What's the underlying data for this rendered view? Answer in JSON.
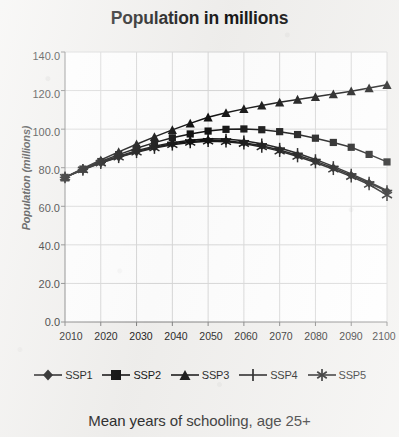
{
  "chart_data": {
    "type": "line",
    "title": "Population in millions",
    "xlabel": "",
    "ylabel": "Population (millions)",
    "x": [
      2010,
      2015,
      2020,
      2025,
      2030,
      2035,
      2040,
      2045,
      2050,
      2055,
      2060,
      2065,
      2070,
      2075,
      2080,
      2085,
      2090,
      2095,
      2100
    ],
    "xlim": [
      2010,
      2100
    ],
    "ylim": [
      0.0,
      140.0
    ],
    "xticks": [
      "2010",
      "2020",
      "2030",
      "2040",
      "2050",
      "2060",
      "2070",
      "2080",
      "2090",
      "2100"
    ],
    "yticks": [
      "0.0",
      "20.0",
      "40.0",
      "60.0",
      "80.0",
      "100.0",
      "120.0",
      "140.0"
    ],
    "grid": true,
    "legend_position": "bottom",
    "series": [
      {
        "name": "SSP1",
        "marker": "diamond",
        "values": [
          75.0,
          79.0,
          82.5,
          85.6,
          88.3,
          90.6,
          92.4,
          93.6,
          94.2,
          94.0,
          93.0,
          91.4,
          89.2,
          86.5,
          83.4,
          79.9,
          76.1,
          72.0,
          67.8
        ]
      },
      {
        "name": "SSP2",
        "marker": "square",
        "values": [
          75.0,
          79.3,
          83.2,
          86.8,
          90.1,
          93.0,
          95.5,
          97.5,
          99.0,
          99.9,
          100.1,
          99.7,
          98.7,
          97.2,
          95.3,
          93.1,
          90.6,
          86.9,
          83.0
        ]
      },
      {
        "name": "SSP3",
        "marker": "triangle",
        "values": [
          75.0,
          79.6,
          84.0,
          88.2,
          92.2,
          96.0,
          99.6,
          103.0,
          106.2,
          108.5,
          110.5,
          112.3,
          113.9,
          115.4,
          116.8,
          118.2,
          119.7,
          121.3,
          123.0
        ]
      },
      {
        "name": "SSP4",
        "marker": "plus",
        "values": [
          75.0,
          79.1,
          82.8,
          86.0,
          88.8,
          91.2,
          93.0,
          94.3,
          95.0,
          94.9,
          94.0,
          92.4,
          90.2,
          87.5,
          84.3,
          80.7,
          76.8,
          72.6,
          68.2
        ]
      },
      {
        "name": "SSP5",
        "marker": "asterisk",
        "values": [
          75.0,
          78.9,
          82.4,
          85.4,
          88.0,
          90.2,
          91.9,
          93.1,
          93.7,
          93.5,
          92.5,
          90.8,
          88.6,
          85.8,
          82.7,
          79.2,
          75.4,
          71.3,
          65.8
        ]
      }
    ]
  },
  "caption": "Mean years of schooling, age 25+",
  "colors": {
    "ink": "#111111",
    "grid": "#d8d8d8",
    "axis": "#808080",
    "plot_background": "#ffffff",
    "page_background": "#f2f1ef"
  }
}
